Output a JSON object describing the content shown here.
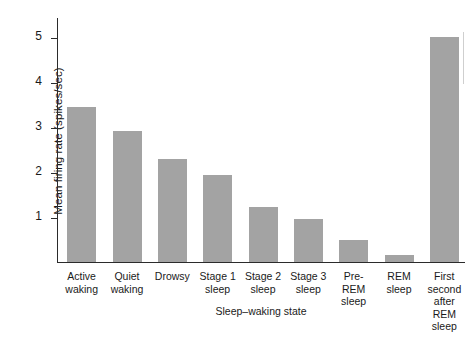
{
  "chart_data": {
    "type": "bar",
    "title": "",
    "xlabel": "Sleep–waking state",
    "ylabel": "Mean firing rate (spikes/sec)",
    "categories": [
      "Active waking",
      "Quiet waking",
      "Drowsy",
      "Stage 1 sleep",
      "Stage 2 sleep",
      "Stage 3 sleep",
      "Pre-REM sleep",
      "REM sleep",
      "First second after REM sleep"
    ],
    "category_lines": [
      [
        "Active",
        "waking"
      ],
      [
        "Quiet",
        "waking"
      ],
      [
        "Drowsy"
      ],
      [
        "Stage 1",
        "sleep"
      ],
      [
        "Stage 2",
        "sleep"
      ],
      [
        "Stage 3",
        "sleep"
      ],
      [
        "Pre-",
        "REM",
        "sleep"
      ],
      [
        "REM",
        "sleep"
      ],
      [
        "First",
        "second",
        "after",
        "REM",
        "sleep"
      ]
    ],
    "values": [
      3.45,
      2.92,
      2.3,
      1.93,
      1.22,
      0.95,
      0.5,
      0.15,
      5.0
    ],
    "ylim": [
      0,
      5.45
    ],
    "yticks": [
      1,
      2,
      3,
      4,
      5
    ],
    "ytick_labels": [
      "1",
      "2",
      "3",
      "4",
      "5"
    ],
    "grid": false,
    "legend": false,
    "bar_color": "#a3a3a3",
    "axis_color": "#2b2b2b",
    "background": "#ffffff"
  }
}
